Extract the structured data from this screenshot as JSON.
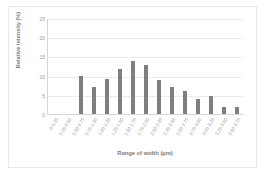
{
  "chart_data": {
    "type": "bar",
    "title": "",
    "xlabel": "Range of width (µm)",
    "ylabel": "Relative intensity (%)",
    "ylim": [
      0,
      25
    ],
    "yticks": [
      0,
      5,
      10,
      15,
      20,
      25
    ],
    "grid": true,
    "legend": false,
    "bar_color": "#7f7f7f",
    "categories": [
      "0-0.25",
      "0.25-0.50",
      "0.50-0.75",
      "0.75-1.00",
      "1.00-1.25",
      "1.25-1.50",
      "1.50-1.75",
      "1.75-2.00",
      "2.00-2.25",
      "2.25-2.50",
      "2.50-2.75",
      "2.75-3.00",
      "3.00-3.25",
      "3.25-3.50",
      "3.50-3.75"
    ],
    "values": [
      0,
      0,
      9.8,
      7.0,
      9.0,
      11.8,
      13.8,
      12.8,
      8.8,
      7.0,
      6.0,
      3.8,
      4.8,
      1.8,
      1.8
    ]
  }
}
